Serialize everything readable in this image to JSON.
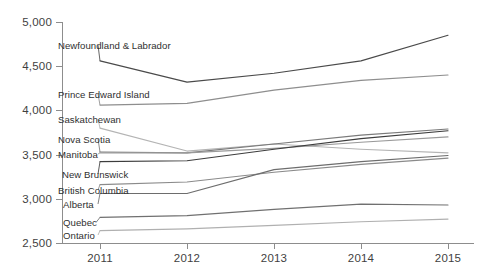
{
  "chart_data": {
    "type": "line",
    "title": "",
    "xlabel": "",
    "ylabel": "",
    "x": [
      2011,
      2012,
      2013,
      2014,
      2015
    ],
    "categories": [
      "2011",
      "2012",
      "2013",
      "2014",
      "2015"
    ],
    "ylim": [
      2500,
      5000
    ],
    "yticks": [
      2500,
      3000,
      3500,
      4000,
      4500,
      5000
    ],
    "ytick_labels": [
      "2,500",
      "3,000",
      "3,500",
      "4,000",
      "4,500",
      "5,000"
    ],
    "grid": false,
    "legend": "inline-left-labels",
    "series": [
      {
        "name": "Newfoundland & Labrador",
        "values": [
          4560,
          4320,
          4420,
          4560,
          4850
        ],
        "color": "#4a4a4a"
      },
      {
        "name": "Prince Edward Island",
        "values": [
          4060,
          4080,
          4230,
          4340,
          4400
        ],
        "color": "#8e8e8e"
      },
      {
        "name": "Saskatchewan",
        "values": [
          3800,
          3540,
          3620,
          3560,
          3520
        ],
        "color": "#b4b4b4"
      },
      {
        "name": "Nova Scotia",
        "values": [
          3530,
          3520,
          3620,
          3720,
          3790
        ],
        "color": "#7a7a7a"
      },
      {
        "name": "Manitoba",
        "values": [
          3520,
          3520,
          3570,
          3640,
          3700
        ],
        "color": "#9a9a9a"
      },
      {
        "name": "New Brunswick",
        "values": [
          3420,
          3430,
          3560,
          3680,
          3770
        ],
        "color": "#3d3d3d"
      },
      {
        "name": "British Columbia",
        "values": [
          3160,
          3190,
          3300,
          3390,
          3460
        ],
        "color": "#8a8a8a"
      },
      {
        "name": "Alberta",
        "values": [
          3060,
          3060,
          3330,
          3420,
          3490
        ],
        "color": "#6d6d6d"
      },
      {
        "name": "Quebec",
        "values": [
          2790,
          2810,
          2880,
          2940,
          2930
        ],
        "color": "#707070"
      },
      {
        "name": "Ontario",
        "values": [
          2640,
          2660,
          2700,
          2740,
          2770
        ],
        "color": "#b0b0b0"
      }
    ],
    "series_label_positions": [
      {
        "name": "Newfoundland & Labrador",
        "x": 58,
        "y": 45
      },
      {
        "name": "Prince Edward Island",
        "x": 58,
        "y": 94
      },
      {
        "name": "Saskatchewan",
        "x": 58,
        "y": 119
      },
      {
        "name": "Nova Scotia",
        "x": 58,
        "y": 139
      },
      {
        "name": "Manitoba",
        "x": 58,
        "y": 154
      },
      {
        "name": "New Brunswick",
        "x": 62,
        "y": 174
      },
      {
        "name": "British Columbia",
        "x": 58,
        "y": 190
      },
      {
        "name": "Alberta",
        "x": 63,
        "y": 204
      },
      {
        "name": "Quebec",
        "x": 63,
        "y": 222
      },
      {
        "name": "Ontario",
        "x": 63,
        "y": 235
      }
    ]
  },
  "axis": {
    "color": "#8d8d8d"
  }
}
